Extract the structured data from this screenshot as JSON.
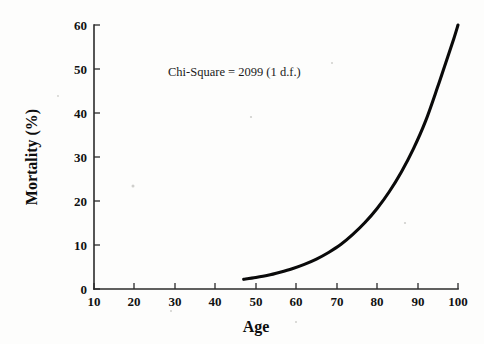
{
  "chart_data": {
    "type": "line",
    "title": "",
    "xlabel": "Age",
    "ylabel": "Mortality (%)",
    "xlim": [
      10,
      100
    ],
    "ylim": [
      0,
      60
    ],
    "xticks": [
      10,
      20,
      30,
      40,
      50,
      60,
      70,
      80,
      90,
      100
    ],
    "yticks": [
      0,
      10,
      20,
      30,
      40,
      50,
      60
    ],
    "xtick_labels": [
      "10",
      "20",
      "30",
      "40",
      "50",
      "60",
      "70",
      "80",
      "90",
      "100"
    ],
    "ytick_labels": [
      "0",
      "10",
      "20",
      "30",
      "40",
      "50",
      "60"
    ],
    "grid": false,
    "legend": null,
    "annotations": [
      {
        "text": "Chi-Square = 2099 (1 d.f.)",
        "x": 53,
        "y": 47
      }
    ],
    "series": [
      {
        "name": "Mortality",
        "color": "#0a0a0a",
        "x": [
          47,
          50,
          53,
          56,
          59,
          62,
          65,
          68,
          71,
          74,
          77,
          80,
          83,
          86,
          89,
          92,
          95,
          97,
          99,
          100
        ],
        "values": [
          2.2,
          2.6,
          3.1,
          3.8,
          4.6,
          5.6,
          6.8,
          8.3,
          10.1,
          12.4,
          15.1,
          18.3,
          22.1,
          26.6,
          31.9,
          38.2,
          46.0,
          51.5,
          57.0,
          60.0
        ]
      }
    ]
  },
  "axis": {
    "x_label": "Age",
    "y_label": "Mortality (%)"
  },
  "annotation": {
    "chi_square": "Chi-Square = 2099 (1 d.f.)"
  },
  "colors": {
    "curve": "#0a0a0a",
    "axis": "#2b2b2b",
    "background": "#fdfdfc",
    "text": "#111111"
  }
}
